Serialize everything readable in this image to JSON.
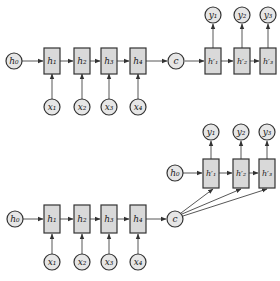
{
  "diagrams": [
    {
      "name": "encoder-decoder-context-initial-state",
      "encoder": {
        "initial_state": {
          "label": "h0",
          "display": "h₀"
        },
        "hidden": [
          {
            "label": "h1",
            "display": "h₁"
          },
          {
            "label": "h2",
            "display": "h₂"
          },
          {
            "label": "h3",
            "display": "h₃"
          },
          {
            "label": "h4",
            "display": "h₄"
          }
        ],
        "inputs": [
          {
            "label": "x1",
            "display": "x₁"
          },
          {
            "label": "x2",
            "display": "x₂"
          },
          {
            "label": "x3",
            "display": "x₃"
          },
          {
            "label": "x4",
            "display": "x₄"
          }
        ]
      },
      "context": {
        "label": "c",
        "display": "c"
      },
      "decoder": {
        "hidden": [
          {
            "label": "h'1",
            "display": "h′₁"
          },
          {
            "label": "h'2",
            "display": "h′₂"
          },
          {
            "label": "h'3",
            "display": "h′₃"
          }
        ],
        "outputs": [
          {
            "label": "y1",
            "display": "y₁"
          },
          {
            "label": "y2",
            "display": "y₂"
          },
          {
            "label": "y3",
            "display": "y₃"
          }
        ]
      }
    },
    {
      "name": "encoder-decoder-context-every-step",
      "encoder": {
        "initial_state": {
          "label": "h0",
          "display": "h₀"
        },
        "hidden": [
          {
            "label": "h1",
            "display": "h₁"
          },
          {
            "label": "h2",
            "display": "h₂"
          },
          {
            "label": "h3",
            "display": "h₃"
          },
          {
            "label": "h4",
            "display": "h₄"
          }
        ],
        "inputs": [
          {
            "label": "x1",
            "display": "x₁"
          },
          {
            "label": "x2",
            "display": "x₂"
          },
          {
            "label": "x3",
            "display": "x₃"
          },
          {
            "label": "x4",
            "display": "x₄"
          }
        ]
      },
      "context": {
        "label": "c",
        "display": "c"
      },
      "decoder": {
        "initial_state": {
          "label": "h0",
          "display": "h₀"
        },
        "hidden": [
          {
            "label": "h'1",
            "display": "h′₁"
          },
          {
            "label": "h'2",
            "display": "h′₂"
          },
          {
            "label": "h'3",
            "display": "h′₃"
          }
        ],
        "outputs": [
          {
            "label": "y1",
            "display": "y₁"
          },
          {
            "label": "y2",
            "display": "y₂"
          },
          {
            "label": "y3",
            "display": "y₃"
          }
        ]
      }
    }
  ],
  "colors": {
    "node_fill": "#d9d9d9",
    "circle_fill": "#e6e6e6",
    "stroke": "#333333",
    "background": "#ffffff"
  }
}
